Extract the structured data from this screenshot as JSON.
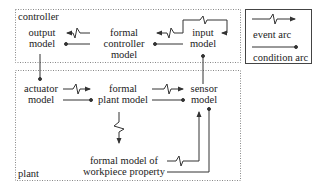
{
  "regions": {
    "controller": {
      "label": "controller"
    },
    "plant": {
      "label": "plant"
    }
  },
  "nodes": {
    "output_model": {
      "line1": "output",
      "line2": "model"
    },
    "formal_controller_model": {
      "line1": "formal",
      "line2": "controller",
      "line3": "model"
    },
    "input_model": {
      "line1": "input",
      "line2": "model"
    },
    "actuator_model": {
      "line1": "actuator",
      "line2": "model"
    },
    "formal_plant_model": {
      "line1": "formal",
      "line2": "plant model"
    },
    "sensor_model": {
      "line1": "sensor",
      "line2": "model"
    },
    "workpiece_property": {
      "line1": "formal model of",
      "line2": "workpiece property"
    }
  },
  "legend": {
    "event_arc": "event arc",
    "condition_arc": "condition arc"
  },
  "colors": {
    "line": "#333333",
    "dotted": "#888888",
    "text": "#222222"
  }
}
